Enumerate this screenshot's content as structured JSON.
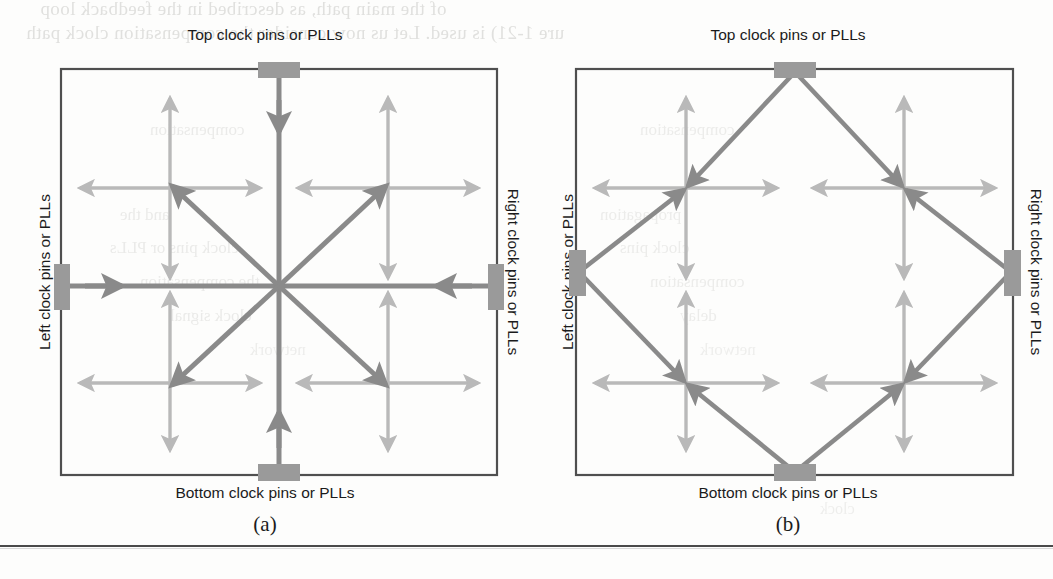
{
  "figure": {
    "panels": [
      {
        "id": "a",
        "caption": "(a)",
        "topology": "star / spine clock network",
        "labels": {
          "top": "Top clock pins or PLLs",
          "bottom": "Bottom clock pins or PLLs",
          "left": "Left clock pins or PLLs",
          "right": "Right clock pins or PLLs"
        }
      },
      {
        "id": "b",
        "caption": "(b)",
        "topology": "diamond / rhombus clock network",
        "labels": {
          "top": "Top clock pins or PLLs",
          "bottom": "Bottom clock pins or PLLs",
          "left": "Left clock pins or PLLs",
          "right": "Right clock pins or PLLs"
        }
      }
    ]
  },
  "colors": {
    "trunk": "#8a8a8a",
    "branch": "#b9b9b9",
    "pin_block": "#9a9a9a",
    "border": "#4f4f4f",
    "text": "#1b1b1b",
    "rule": "#4a4a4a"
  },
  "bleed_text": {
    "line1": "of the main path, as described in the feedback loop",
    "line2": "ure 1-21) is used. Let us now consider the compensation clock path",
    "frag1": "compensation",
    "frag2": "and the",
    "frag3": "clock pins or PLLs",
    "frag4": "the compensation",
    "frag5": "clock signal",
    "frag6": "network",
    "frag7": "compensation",
    "frag8": "propagation",
    "frag9": "clock pins",
    "frag10": "compensation",
    "frag11": "delay",
    "frag12": "network",
    "frag13": "clock"
  }
}
